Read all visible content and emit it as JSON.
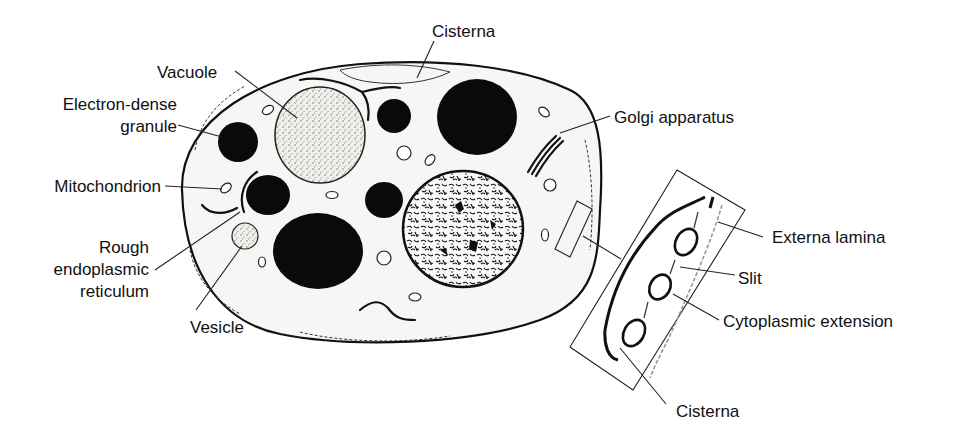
{
  "figure": {
    "labels": {
      "cisterna_top": "Cisterna",
      "vacuole": "Vacuole",
      "electron_dense_granule_line1": "Electron-dense",
      "electron_dense_granule_line2": "granule",
      "mitochondrion": "Mitochondrion",
      "rough_er_line1": "Rough",
      "rough_er_line2": "endoplasmic",
      "rough_er_line3": "reticulum",
      "vesicle": "Vesicle",
      "golgi": "Golgi apparatus",
      "externa_lamina": "Externa lamina",
      "slit": "Slit",
      "cytoplasmic_extension": "Cytoplasmic extension",
      "cisterna_bottom": "Cisterna"
    },
    "colors": {
      "ink": "#111111",
      "background": "#ffffff",
      "cytoplasm": "#f6f6f4"
    }
  }
}
